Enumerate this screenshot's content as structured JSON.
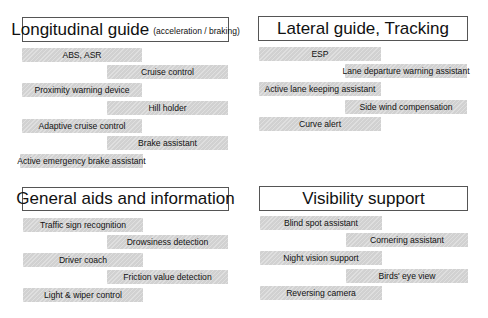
{
  "sections": [
    {
      "title": "Longitudinal guide",
      "subtitle": "(acceleration / braking)",
      "items": [
        "ABS, ASR",
        "Cruise control",
        "Proximity warning device",
        "Hill holder",
        "Adaptive cruise control",
        "Brake assistant",
        "Active emergency brake assistant"
      ]
    },
    {
      "title": "Lateral guide, Tracking",
      "items": [
        "ESP",
        "Lane departure warning assistant",
        "Active lane keeping assistant",
        "Side wind compensation",
        "Curve alert"
      ]
    },
    {
      "title": "General aids and information",
      "items": [
        "Traffic sign recognition",
        "Drowsiness detection",
        "Driver coach",
        "Friction value detection",
        "Light & wiper control"
      ]
    },
    {
      "title": "Visibility support",
      "items": [
        "Blind spot assistant",
        "Cornering assistant",
        "Night vision support",
        "Birds' eye view",
        "Reversing camera"
      ]
    }
  ],
  "colors": {
    "bar_fill": "#d8d8d8",
    "title_border": "#555555",
    "text": "#111111"
  }
}
